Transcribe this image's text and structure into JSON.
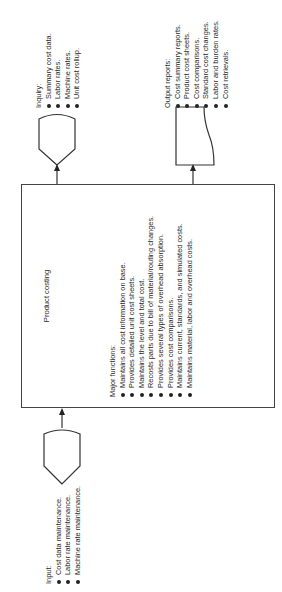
{
  "diagram": {
    "title": "Product costing",
    "process": {
      "title": "Product costing",
      "functions_heading": "Major functions:",
      "functions": [
        "Maintains all cost information on base.",
        "Provides detailed unit cost sheets.",
        "Maintains the level and total cost.",
        "Recosts parts due to bill of material/routing changes.",
        "Provides several types of overhead absorption.",
        "Provides cost comparisons.",
        "Maintains current, standards, and simulated costs.",
        "Maintains material, labor and overhead costs."
      ]
    },
    "input": {
      "heading": "Input:",
      "symbol": "manual-input-terminal",
      "items": [
        "Cost data maintenance.",
        "Labor rate maintenance.",
        "Machine rate maintenance."
      ]
    },
    "inquiry": {
      "heading": "Inquiry:",
      "symbol": "display-terminal",
      "items": [
        "Summary cost data.",
        "Labor rates.",
        "Machine rates.",
        "Unit cost rollup."
      ]
    },
    "output": {
      "heading": "Output reports:",
      "symbol": "document",
      "items": [
        "Cost summary reports.",
        "Product cost sheets.",
        "Cost comparisons.",
        "Standard cost changes.",
        "Labor and burden rates.",
        "Cost retrievals."
      ]
    },
    "orientation": "rotated 90 degrees counter-clockwise",
    "colors": {
      "line": "#444444",
      "text": "#2a2a2a",
      "background": "#ffffff"
    }
  }
}
